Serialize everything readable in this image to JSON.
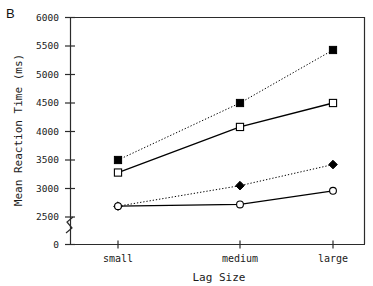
{
  "panel": {
    "label": "B"
  },
  "chart_data": {
    "type": "line",
    "title": "",
    "panel_label": "B",
    "xlabel": "Lag Size",
    "ylabel": "Mean Reaction Time (ms)",
    "categories": [
      "small",
      "medium",
      "large"
    ],
    "ytick_labels": [
      "0",
      "2500",
      "3000",
      "3500",
      "4000",
      "4500",
      "5000",
      "5500",
      "6000"
    ],
    "ytick_values": [
      0,
      2500,
      3000,
      3500,
      4000,
      4500,
      5000,
      5500,
      6000
    ],
    "ylim": [
      2400,
      6000
    ],
    "axis_break": true,
    "axis_break_note": "y-axis broken between 0 and 2500",
    "grid": false,
    "legend": "none",
    "series": [
      {
        "name": "filled-square-dotted",
        "marker": "filled-square",
        "linestyle": "dotted",
        "color": "#000000",
        "values": [
          3500,
          4500,
          5430
        ]
      },
      {
        "name": "open-square-solid",
        "marker": "open-square",
        "linestyle": "solid",
        "color": "#000000",
        "values": [
          3280,
          4080,
          4500
        ]
      },
      {
        "name": "filled-diamond-dotted",
        "marker": "filled-diamond",
        "linestyle": "dotted",
        "color": "#000000",
        "values": [
          2690,
          3050,
          3420
        ]
      },
      {
        "name": "open-circle-solid",
        "marker": "open-circle",
        "linestyle": "solid",
        "color": "#000000",
        "values": [
          2690,
          2720,
          2960
        ]
      }
    ]
  }
}
